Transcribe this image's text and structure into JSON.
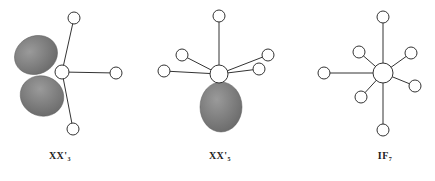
{
  "figure": {
    "colors": {
      "bond": "#333333",
      "atom_fill": "#ffffff",
      "atom_stroke": "#333333",
      "lobe": "#7a7a7a",
      "lobe_highlight": "#a0a0a0"
    },
    "molecules": [
      {
        "id": "xx3",
        "label_main": "XX'",
        "label_sub": "3",
        "label_x": 30,
        "center": {
          "x": 62,
          "y": 72,
          "r": 7
        },
        "ligands": [
          {
            "x": 74,
            "y": 18,
            "r": 6
          },
          {
            "x": 116,
            "y": 73,
            "r": 6
          },
          {
            "x": 73,
            "y": 129,
            "r": 6
          }
        ],
        "lobes": [
          {
            "cx": 36,
            "cy": 55,
            "rx": 22,
            "ry": 19,
            "rot": -25
          },
          {
            "cx": 42,
            "cy": 96,
            "rx": 22,
            "ry": 20,
            "rot": 20
          }
        ]
      },
      {
        "id": "xx5",
        "label_main": "XX'",
        "label_sub": "5",
        "label_x": 190,
        "center": {
          "x": 219,
          "y": 74,
          "r": 9
        },
        "ligands": [
          {
            "x": 219,
            "y": 16,
            "r": 6
          },
          {
            "x": 182,
            "y": 55,
            "r": 6
          },
          {
            "x": 164,
            "y": 71,
            "r": 6
          },
          {
            "x": 268,
            "y": 55,
            "r": 6
          },
          {
            "x": 259,
            "y": 69,
            "r": 6
          }
        ],
        "lobes": [
          {
            "cx": 221,
            "cy": 107,
            "rx": 21,
            "ry": 25,
            "rot": 0
          }
        ]
      },
      {
        "id": "if7",
        "label_main": "IF",
        "label_sub": "7",
        "label_x": 355,
        "center": {
          "x": 383,
          "y": 73,
          "r": 10
        },
        "ligands": [
          {
            "x": 383,
            "y": 17,
            "r": 6
          },
          {
            "x": 383,
            "y": 130,
            "r": 6
          },
          {
            "x": 324,
            "y": 73,
            "r": 6
          },
          {
            "x": 359,
            "y": 52,
            "r": 6
          },
          {
            "x": 411,
            "y": 53,
            "r": 6
          },
          {
            "x": 415,
            "y": 86,
            "r": 6
          },
          {
            "x": 361,
            "y": 97,
            "r": 6
          }
        ],
        "lobes": []
      }
    ]
  },
  "labels": {
    "xx3": {
      "main": "XX'",
      "sub": "3"
    },
    "xx5": {
      "main": "XX'",
      "sub": "5"
    },
    "if7": {
      "main": "IF",
      "sub": "7"
    }
  }
}
